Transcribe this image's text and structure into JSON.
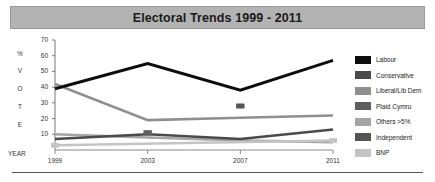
{
  "title": "Electoral Trends 1999 - 2011",
  "axis": {
    "year_label": "YEAR",
    "vertical_label_letters": [
      "%",
      "V",
      "O",
      "T",
      "E"
    ]
  },
  "legend": {
    "items": [
      {
        "label": "Labour",
        "color": "#0d0d0d"
      },
      {
        "label": "Conservative",
        "color": "#4a4a4a"
      },
      {
        "label": "Liberal/Lib Dem",
        "color": "#8f8f8f"
      },
      {
        "label": "Plaid Cymru",
        "color": "#5e5e5e"
      },
      {
        "label": "Others >5%",
        "color": "#a5a5a5"
      },
      {
        "label": "Independent",
        "color": "#555555"
      },
      {
        "label": "BNP",
        "color": "#c4c4c4"
      }
    ]
  },
  "chart_data": {
    "type": "line",
    "title": "Electoral Trends 1999 - 2011",
    "xlabel": "YEAR",
    "ylabel": "% VOTE",
    "categories": [
      "1999",
      "2003",
      "2007",
      "2011"
    ],
    "x": [
      1999,
      2003,
      2007,
      2011
    ],
    "ylim": [
      0,
      70
    ],
    "yticks": [
      10,
      20,
      30,
      40,
      50,
      60,
      70
    ],
    "grid": false,
    "legend_position": "right",
    "series": [
      {
        "name": "Labour",
        "color": "#0d0d0d",
        "values": [
          39,
          55,
          38,
          57
        ]
      },
      {
        "name": "Conservative",
        "color": "#4a4a4a",
        "values": [
          7,
          10,
          7,
          13
        ]
      },
      {
        "name": "Liberal/Lib Dem",
        "color": "#8f8f8f",
        "values": [
          42,
          19,
          20.5,
          22
        ]
      },
      {
        "name": "Plaid Cymru",
        "color": "#5e5e5e",
        "values": [
          null,
          11,
          null,
          null
        ]
      },
      {
        "name": "Others >5%",
        "color": "#a5a5a5",
        "values": [
          10,
          8,
          6,
          5
        ]
      },
      {
        "name": "Independent",
        "color": "#555555",
        "values": [
          null,
          null,
          28,
          null
        ]
      },
      {
        "name": "BNP",
        "color": "#c4c4c4",
        "values": [
          3,
          null,
          null,
          6
        ]
      }
    ]
  }
}
